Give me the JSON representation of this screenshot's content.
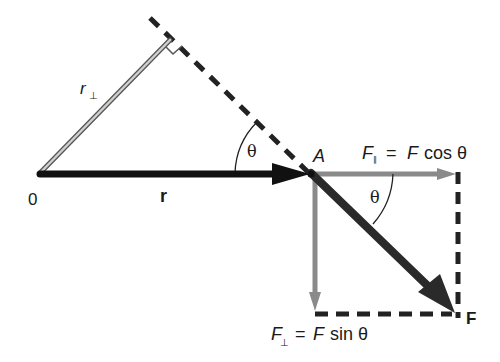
{
  "diagram": {
    "type": "torque-vector-decomposition",
    "colors": {
      "background": "#ffffff",
      "r_vector": "#111111",
      "F_vector": "#2a2a2a",
      "components": "#8a8a8a",
      "r_perp_fill": "#c8c8c8",
      "r_perp_edge": "#555555",
      "dashed": "#222222",
      "text": "#1a1a1a"
    },
    "points": {
      "origin": {
        "label": "0"
      },
      "A": {
        "label": "A"
      }
    },
    "vectors": {
      "r": {
        "label": "r"
      },
      "F": {
        "label": "F"
      },
      "r_perp": {
        "label_main": "r",
        "label_sub": "⊥"
      },
      "F_parallel": {
        "label_main": "F",
        "label_sub": "∥",
        "equals": "=",
        "rhs_var": "F",
        "rhs_func": "cos θ"
      },
      "F_perp": {
        "label_main": "F",
        "label_sub": "⊥",
        "equals": "=",
        "rhs_var": "F",
        "rhs_func": "sin θ"
      }
    },
    "angles": {
      "theta_at_r": {
        "label": "θ"
      },
      "theta_at_F": {
        "label": "θ"
      }
    }
  }
}
